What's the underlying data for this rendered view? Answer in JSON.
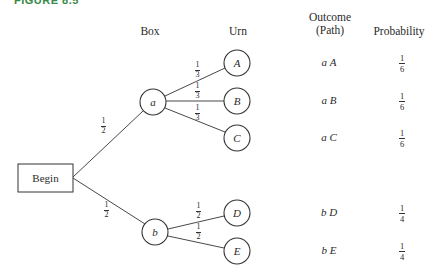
{
  "figure": {
    "label": "FIGURE 8.5"
  },
  "headers": {
    "box": "Box",
    "urn": "Urn",
    "outcome_line1": "Outcome",
    "outcome_line2": "(Path)",
    "probability": "Probability"
  },
  "nodes": {
    "begin": "Begin",
    "a": "a",
    "b": "b",
    "A": "A",
    "B": "B",
    "C": "C",
    "D": "D",
    "E": "E"
  },
  "edges": [
    {
      "from": "Begin",
      "to": "a",
      "num": "1",
      "den": "2"
    },
    {
      "from": "Begin",
      "to": "b",
      "num": "1",
      "den": "2"
    },
    {
      "from": "a",
      "to": "A",
      "num": "1",
      "den": "3"
    },
    {
      "from": "a",
      "to": "B",
      "num": "1",
      "den": "3"
    },
    {
      "from": "a",
      "to": "C",
      "num": "1",
      "den": "3"
    },
    {
      "from": "b",
      "to": "D",
      "num": "1",
      "den": "2"
    },
    {
      "from": "b",
      "to": "E",
      "num": "1",
      "den": "2"
    }
  ],
  "outcomes": [
    {
      "path": "a A",
      "num": "1",
      "den": "6"
    },
    {
      "path": "a B",
      "num": "1",
      "den": "6"
    },
    {
      "path": "a C",
      "num": "1",
      "den": "6"
    },
    {
      "path": "b D",
      "num": "1",
      "den": "4"
    },
    {
      "path": "b E",
      "num": "1",
      "den": "4"
    }
  ]
}
